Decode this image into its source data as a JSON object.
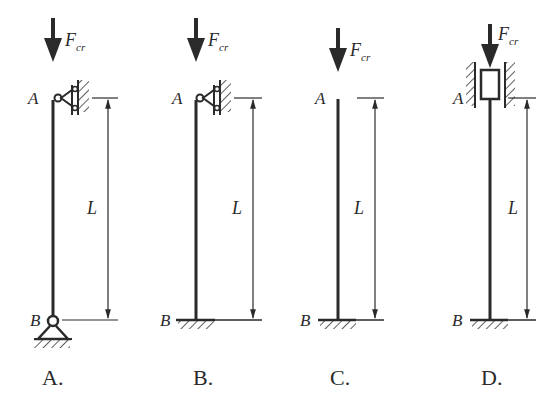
{
  "figure": {
    "panels": [
      {
        "caption": "A.",
        "top_label": "A",
        "bottom_label": "B",
        "length_label": "L",
        "force_label": "F",
        "force_subscript": "cr",
        "top_support": "roller-guided pin",
        "bottom_support": "pin"
      },
      {
        "caption": "B.",
        "top_label": "A",
        "bottom_label": "B",
        "length_label": "L",
        "force_label": "F",
        "force_subscript": "cr",
        "top_support": "roller-guided pin",
        "bottom_support": "fixed"
      },
      {
        "caption": "C.",
        "top_label": "A",
        "bottom_label": "B",
        "length_label": "L",
        "force_label": "F",
        "force_subscript": "cr",
        "top_support": "free",
        "bottom_support": "fixed"
      },
      {
        "caption": "D.",
        "top_label": "A",
        "bottom_label": "B",
        "length_label": "L",
        "force_label": "F",
        "force_subscript": "cr",
        "top_support": "sliding guide",
        "bottom_support": "fixed"
      }
    ]
  }
}
